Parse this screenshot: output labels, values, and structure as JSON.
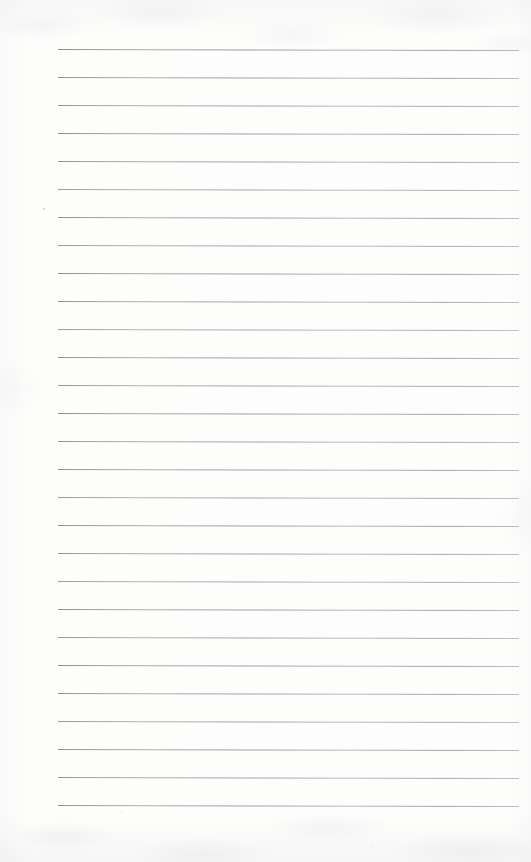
{
  "document": {
    "kind": "lined-notebook-paper-scan",
    "title": "Blank ruled paper",
    "orientation": "portrait",
    "page_width_px": 531,
    "page_height_px": 862,
    "written_content": "",
    "has_text": false,
    "has_margin_line": false,
    "has_holes": false
  },
  "paper": {
    "background_color": "#fdfdfc",
    "texture_tint": "#92929a",
    "edge_shadow_color": "#92929a"
  },
  "ruling": {
    "line_color": "#84848c",
    "line_thickness_px": 1,
    "line_count": 28,
    "spacing_px": 28,
    "first_line_y_px": 49,
    "last_line_y_px": 805,
    "left_margin_px": 58,
    "right_margin_px": 12,
    "line_start_x_px": 58,
    "line_end_x_px": 519,
    "slant_deg": 0.13,
    "lines": [
      {
        "index": 1,
        "y": 49,
        "x_start": 58,
        "x_end": 519,
        "opacity": 0.92
      },
      {
        "index": 2,
        "y": 77,
        "x_start": 58,
        "x_end": 519,
        "opacity": 0.88
      },
      {
        "index": 3,
        "y": 105,
        "x_start": 58,
        "x_end": 519,
        "opacity": 0.84
      },
      {
        "index": 4,
        "y": 133,
        "x_start": 58,
        "x_end": 519,
        "opacity": 0.9
      },
      {
        "index": 5,
        "y": 161,
        "x_start": 58,
        "x_end": 519,
        "opacity": 0.86
      },
      {
        "index": 6,
        "y": 189,
        "x_start": 58,
        "x_end": 519,
        "opacity": 0.8
      },
      {
        "index": 7,
        "y": 217,
        "x_start": 58,
        "x_end": 519,
        "opacity": 0.88
      },
      {
        "index": 8,
        "y": 245,
        "x_start": 58,
        "x_end": 519,
        "opacity": 0.82
      },
      {
        "index": 9,
        "y": 273,
        "x_start": 58,
        "x_end": 519,
        "opacity": 0.9
      },
      {
        "index": 10,
        "y": 301,
        "x_start": 58,
        "x_end": 519,
        "opacity": 0.85
      },
      {
        "index": 11,
        "y": 329,
        "x_start": 58,
        "x_end": 519,
        "opacity": 0.79
      },
      {
        "index": 12,
        "y": 357,
        "x_start": 58,
        "x_end": 519,
        "opacity": 0.88
      },
      {
        "index": 13,
        "y": 385,
        "x_start": 58,
        "x_end": 519,
        "opacity": 0.83
      },
      {
        "index": 14,
        "y": 413,
        "x_start": 58,
        "x_end": 519,
        "opacity": 0.9
      },
      {
        "index": 15,
        "y": 441,
        "x_start": 58,
        "x_end": 519,
        "opacity": 0.84
      },
      {
        "index": 16,
        "y": 469,
        "x_start": 58,
        "x_end": 519,
        "opacity": 0.87
      },
      {
        "index": 17,
        "y": 497,
        "x_start": 58,
        "x_end": 519,
        "opacity": 0.81
      },
      {
        "index": 18,
        "y": 525,
        "x_start": 58,
        "x_end": 519,
        "opacity": 0.89
      },
      {
        "index": 19,
        "y": 553,
        "x_start": 58,
        "x_end": 519,
        "opacity": 0.85
      },
      {
        "index": 20,
        "y": 581,
        "x_start": 58,
        "x_end": 519,
        "opacity": 0.8
      },
      {
        "index": 21,
        "y": 609,
        "x_start": 58,
        "x_end": 519,
        "opacity": 0.88
      },
      {
        "index": 22,
        "y": 637,
        "x_start": 58,
        "x_end": 519,
        "opacity": 0.83
      },
      {
        "index": 23,
        "y": 665,
        "x_start": 58,
        "x_end": 519,
        "opacity": 0.9
      },
      {
        "index": 24,
        "y": 693,
        "x_start": 58,
        "x_end": 519,
        "opacity": 0.86
      },
      {
        "index": 25,
        "y": 721,
        "x_start": 58,
        "x_end": 519,
        "opacity": 0.82
      },
      {
        "index": 26,
        "y": 749,
        "x_start": 58,
        "x_end": 519,
        "opacity": 0.89
      },
      {
        "index": 27,
        "y": 777,
        "x_start": 58,
        "x_end": 519,
        "opacity": 0.85
      },
      {
        "index": 28,
        "y": 805,
        "x_start": 58,
        "x_end": 519,
        "opacity": 0.88
      }
    ]
  },
  "artifacts": {
    "specks": [
      {
        "x": 43,
        "y": 208,
        "size": 2
      },
      {
        "x": 121,
        "y": 812,
        "size": 1
      },
      {
        "x": 372,
        "y": 845,
        "size": 1
      }
    ]
  }
}
